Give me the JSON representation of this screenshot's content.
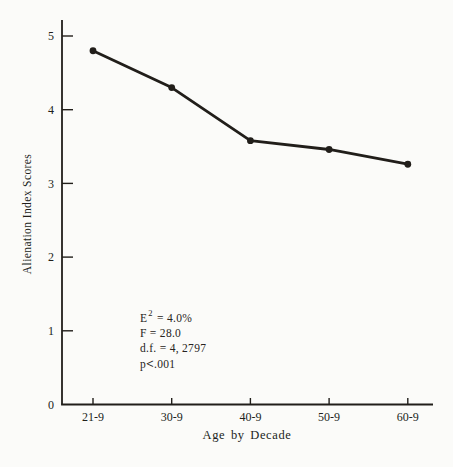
{
  "page": {
    "background": "#fbfbf9",
    "ink": "#211e1a"
  },
  "chart_data": {
    "type": "line",
    "title": "",
    "categories": [
      "21-9",
      "30-9",
      "40-9",
      "50-9",
      "60-9"
    ],
    "values": [
      4.8,
      4.3,
      3.58,
      3.46,
      3.26
    ],
    "xlabel": "Age by Decade",
    "ylabel": "Alienation Index Scores",
    "ylim": [
      0,
      5
    ],
    "yticks": [
      "0",
      "1",
      "2",
      "3",
      "4",
      "5"
    ],
    "grid": false,
    "legend": "none",
    "marker": "filled-circle",
    "line_color": "#211e1a",
    "annotations": [
      "E² = 4.0%",
      "F = 28.0",
      "d.f. = 4, 2797",
      "p<.001"
    ]
  },
  "annotation_box": {
    "line1_base": "E",
    "line1_sup": "2",
    "line1_rest": " = 4.0%",
    "line2": "F = 28.0",
    "line3": "d.f. = 4, 2797",
    "line4_p": "p",
    "line4_lt": "<",
    "line4_val": ".001"
  }
}
